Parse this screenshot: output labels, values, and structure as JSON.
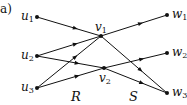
{
  "panel_label": "a)",
  "nodes": {
    "u1": {
      "name": "u",
      "sub": "1",
      "x": 37,
      "y": 17
    },
    "u2": {
      "name": "u",
      "sub": "2",
      "x": 37,
      "y": 56
    },
    "u3": {
      "name": "u",
      "sub": "3",
      "x": 37,
      "y": 88
    },
    "v1": {
      "name": "v",
      "sub": "1",
      "x": 101,
      "y": 36
    },
    "v2": {
      "name": "v",
      "sub": "2",
      "x": 104,
      "y": 68
    },
    "w1": {
      "name": "w",
      "sub": "1",
      "x": 167,
      "y": 15
    },
    "w2": {
      "name": "w",
      "sub": "2",
      "x": 167,
      "y": 53
    },
    "w3": {
      "name": "w",
      "sub": "3",
      "x": 167,
      "y": 93
    }
  },
  "edges": [
    {
      "from": "u1",
      "to": "v1"
    },
    {
      "from": "u2",
      "to": "v1"
    },
    {
      "from": "u2",
      "to": "v2"
    },
    {
      "from": "u3",
      "to": "v1"
    },
    {
      "from": "u3",
      "to": "v2"
    },
    {
      "from": "v1",
      "to": "w1"
    },
    {
      "from": "v1",
      "to": "w3"
    },
    {
      "from": "v2",
      "to": "w2"
    },
    {
      "from": "v2",
      "to": "w3"
    }
  ],
  "set_labels": {
    "left": "R",
    "right": "S"
  },
  "colors": {
    "stroke": "#111111",
    "background": "#ffffff"
  }
}
